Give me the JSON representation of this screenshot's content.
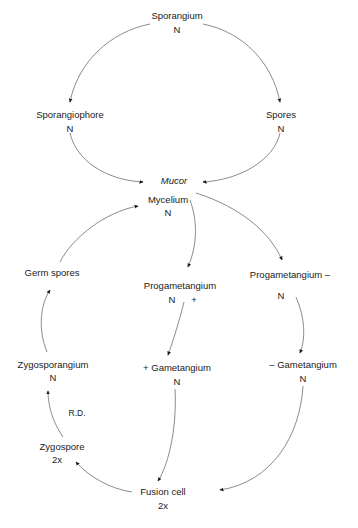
{
  "diagram": {
    "organism": "Mucor",
    "line_color": "#6e6e6e",
    "text_color": "#1a1a1a",
    "nodes": {
      "sporangium": {
        "label": "Sporangium",
        "ploidy": "N"
      },
      "sporangiophore": {
        "label": "Sporangiophore",
        "ploidy": "N"
      },
      "spores": {
        "label": "Spores",
        "ploidy": "N"
      },
      "mucor": {
        "label": "Mucor",
        "ploidy": ""
      },
      "mycelium": {
        "label": "Mycelium",
        "ploidy": "N"
      },
      "germ_spores": {
        "label": "Germ spores",
        "ploidy": ""
      },
      "progametangium_plus": {
        "label": "Progametangium",
        "ploidy": "N",
        "sign": "+"
      },
      "progametangium_minus": {
        "label": "Progametangium –",
        "ploidy": "N"
      },
      "zygosporangium": {
        "label": "Zygosporangium",
        "ploidy": "N"
      },
      "gametangium_plus": {
        "label": "+ Gametangium",
        "ploidy": "N"
      },
      "gametangium_minus": {
        "label": "– Gametangium",
        "ploidy": "N"
      },
      "zygospore": {
        "label": "Zygospore",
        "ploidy": "2x"
      },
      "fusion_cell": {
        "label": "Fusion cell",
        "ploidy": "2x"
      }
    },
    "edge_labels": {
      "reduction_division": "R.D."
    },
    "caption": ""
  }
}
